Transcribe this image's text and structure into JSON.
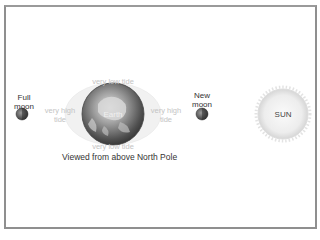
{
  "diagram": {
    "caption": "Viewed from above North Pole",
    "full_moon": {
      "label_line1": "Full",
      "label_line2": "moon"
    },
    "new_moon": {
      "label_line1": "New",
      "label_line2": "moon"
    },
    "earth": {
      "label": "Earth"
    },
    "sun": {
      "label": "SUN"
    },
    "tides": {
      "top": "very low tide",
      "bottom": "very low tide",
      "left_line1": "very high",
      "left_line2": "tide",
      "right_line1": "very high",
      "right_line2": "tide"
    },
    "colors": {
      "frame": "#8f8f8f",
      "sun_fill": "#f2f2f2",
      "sun_glow": "#d9d9d9",
      "earth_dark": "#4a4a4a",
      "bulge": "#eeeeee",
      "moon": "#555555",
      "faint_text": "#c4c4c4"
    }
  }
}
